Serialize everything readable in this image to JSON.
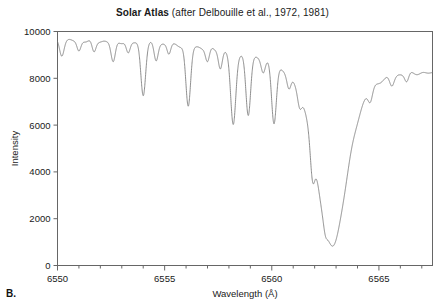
{
  "panel": {
    "label": "B."
  },
  "chart_data": {
    "type": "line",
    "title": "Solar Atlas (after Delbouille et al., 1972, 1981)",
    "title_parts": {
      "bold": "Solar Atlas",
      "regular": " (after Delbouille et al., 1972, 1981)"
    },
    "xlabel": "Wavelength (Å)",
    "ylabel": "Intensity",
    "xlim": [
      6550,
      6567.5
    ],
    "ylim": [
      0,
      10000
    ],
    "xticks": [
      6550,
      6555,
      6560,
      6565
    ],
    "xtick_labels": [
      "6550",
      "6555",
      "6560",
      "6565"
    ],
    "xminor_step": 1,
    "yticks": [
      0,
      2000,
      4000,
      6000,
      8000,
      10000
    ],
    "ytick_labels": [
      "0",
      "2000",
      "4000",
      "6000",
      "8000",
      "10000"
    ],
    "grid": false,
    "legend": null,
    "series_name": "solar spectrum",
    "line_color": "#808080",
    "axis_color": "#666666",
    "continuum_level": 9650,
    "absorption_lines": [
      {
        "center": 6550.2,
        "depth": 600,
        "width": 0.1
      },
      {
        "center": 6551.0,
        "depth": 450,
        "width": 0.09
      },
      {
        "center": 6551.7,
        "depth": 500,
        "width": 0.09
      },
      {
        "center": 6552.6,
        "depth": 900,
        "width": 0.1
      },
      {
        "center": 6553.3,
        "depth": 500,
        "width": 0.09
      },
      {
        "center": 6554.0,
        "depth": 2200,
        "width": 0.11
      },
      {
        "center": 6554.6,
        "depth": 700,
        "width": 0.09
      },
      {
        "center": 6555.2,
        "depth": 400,
        "width": 0.08
      },
      {
        "center": 6556.1,
        "depth": 2600,
        "width": 0.11
      },
      {
        "center": 6557.0,
        "depth": 600,
        "width": 0.09
      },
      {
        "center": 6557.6,
        "depth": 800,
        "width": 0.09
      },
      {
        "center": 6558.2,
        "depth": 3150,
        "width": 0.12
      },
      {
        "center": 6558.9,
        "depth": 2600,
        "width": 0.11
      },
      {
        "center": 6559.6,
        "depth": 500,
        "width": 0.09
      },
      {
        "center": 6560.1,
        "depth": 2500,
        "width": 0.11
      },
      {
        "center": 6560.8,
        "depth": 550,
        "width": 0.09
      },
      {
        "center": 6561.3,
        "depth": 500,
        "width": 0.09
      },
      {
        "center": 6561.9,
        "depth": 1400,
        "width": 0.1
      },
      {
        "center": 6562.5,
        "depth": 300,
        "width": 0.08
      },
      {
        "center": 6564.6,
        "depth": 500,
        "width": 0.1
      },
      {
        "center": 6565.6,
        "depth": 400,
        "width": 0.1
      },
      {
        "center": 6566.3,
        "depth": 350,
        "width": 0.09
      }
    ],
    "halpha": {
      "center": 6562.8,
      "depth": 8000,
      "width": 1.05,
      "min_intensity": 1650,
      "name": "H-alpha"
    },
    "continuum_slope": {
      "left_value": 9650,
      "right_value": 8450
    },
    "notable_values": {
      "left_edge_intensity": 9600,
      "right_edge_intensity": 8400,
      "deepest_narrow_line_intensity": 6700,
      "halpha_core_intensity": 1650
    }
  }
}
